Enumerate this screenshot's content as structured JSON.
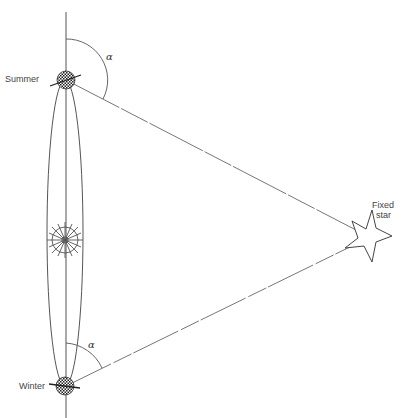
{
  "diagram": {
    "labels": {
      "summer": "Summer",
      "winter": "Winter",
      "fixed_star_line1": "Fixed",
      "fixed_star_line2": "star",
      "angle_top": "α",
      "angle_bottom": "α"
    },
    "elements": {
      "earth_summer": {
        "cx": 66,
        "cy": 80,
        "r": 9
      },
      "earth_winter": {
        "cx": 65,
        "cy": 386,
        "r": 9
      },
      "sun": {
        "cx": 65,
        "cy": 240,
        "r": 17
      },
      "fixed_star": {
        "cx": 368,
        "cy": 236
      },
      "orbit": {
        "cx": 65,
        "cy": 233,
        "rx": 18,
        "ry": 153
      }
    },
    "colors": {
      "line": "#555555",
      "text": "#444444",
      "background": "#ffffff"
    }
  }
}
